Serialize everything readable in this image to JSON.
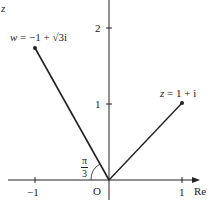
{
  "diagram": {
    "axes": {
      "imag_label": "z",
      "real_label": "Re",
      "origin_label": "O",
      "x_ticks": [
        "−1",
        "1"
      ],
      "y_ticks": [
        "1",
        "2"
      ]
    },
    "points": [
      {
        "name": "w",
        "label_var": "w",
        "label_rest": " = −1 + √3i",
        "re": -1,
        "im": 1.732
      },
      {
        "name": "z",
        "label_var": "z",
        "label_rest": " = 1 + i",
        "re": 1,
        "im": 1
      }
    ],
    "angle": {
      "numerator": "π",
      "denominator": "3"
    },
    "colors": {
      "line": "#222222",
      "background": "#ffffff"
    }
  }
}
